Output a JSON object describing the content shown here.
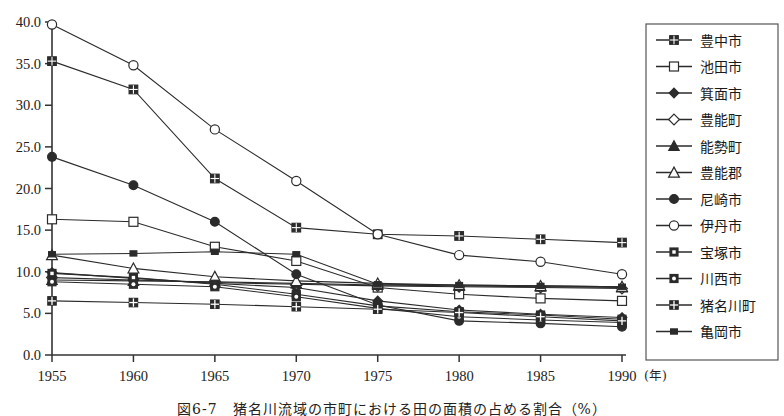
{
  "figure": {
    "caption": "図6-7　猪名川流域の市町における田の面積の占める割合（%）",
    "x_unit_label": "(年)"
  },
  "chart_data": {
    "type": "line",
    "title": "猪名川流域の市町における田の面積の占める割合（%）",
    "xlabel": "年",
    "ylabel": "",
    "x": [
      1955,
      1960,
      1965,
      1970,
      1975,
      1980,
      1985,
      1990
    ],
    "xlim": [
      1955,
      1990
    ],
    "ylim": [
      0.0,
      40.0
    ],
    "ytick_labels": [
      "0.0",
      "5.0",
      "10.0",
      "15.0",
      "20.0",
      "25.0",
      "30.0",
      "35.0",
      "40.0"
    ],
    "yticks": [
      0.0,
      5.0,
      10.0,
      15.0,
      20.0,
      25.0,
      30.0,
      35.0,
      40.0
    ],
    "xtick_labels": [
      "1955",
      "1960",
      "1965",
      "1970",
      "1975",
      "1980",
      "1985",
      "1990"
    ],
    "grid": false,
    "legend_position": "right",
    "series": [
      {
        "name": "豊中市",
        "marker": "filled-square-grid",
        "values": [
          35.3,
          31.9,
          21.2,
          15.3,
          14.5,
          14.3,
          13.9,
          13.5
        ]
      },
      {
        "name": "池田市",
        "marker": "open-square",
        "values": [
          16.3,
          16.0,
          13.0,
          11.3,
          8.1,
          7.3,
          6.8,
          6.5
        ]
      },
      {
        "name": "箕面市",
        "marker": "filled-diamond",
        "values": [
          9.9,
          9.2,
          8.6,
          8.1,
          6.5,
          5.4,
          4.9,
          4.5
        ]
      },
      {
        "name": "豊能町",
        "marker": "open-diamond",
        "values": [
          9.3,
          9.0,
          8.7,
          8.5,
          8.3,
          8.2,
          8.1,
          8.0
        ]
      },
      {
        "name": "能勢町",
        "marker": "filled-triangle",
        "values": [
          9.0,
          8.9,
          8.8,
          8.6,
          8.4,
          8.3,
          8.2,
          8.1
        ]
      },
      {
        "name": "豊能郡",
        "marker": "open-triangle",
        "values": [
          12.0,
          10.4,
          9.4,
          8.9,
          8.6,
          8.4,
          8.3,
          8.2
        ]
      },
      {
        "name": "尼崎市",
        "marker": "filled-circle",
        "values": [
          23.8,
          20.4,
          16.0,
          9.7,
          6.0,
          4.1,
          3.8,
          3.4
        ]
      },
      {
        "name": "伊丹市",
        "marker": "open-circle",
        "values": [
          39.7,
          34.8,
          27.1,
          20.9,
          14.5,
          12.0,
          11.2,
          9.7
        ]
      },
      {
        "name": "宝塚市",
        "marker": "square-dot-small",
        "values": [
          9.8,
          9.3,
          8.5,
          7.3,
          5.9,
          5.2,
          4.8,
          4.3
        ]
      },
      {
        "name": "川西市",
        "marker": "square-ring-small",
        "values": [
          8.8,
          8.5,
          8.2,
          7.0,
          5.6,
          4.6,
          4.2,
          3.9
        ]
      },
      {
        "name": "猪名川町",
        "marker": "square-cross-small",
        "values": [
          6.5,
          6.3,
          6.1,
          5.8,
          5.5,
          5.1,
          4.6,
          4.1
        ]
      },
      {
        "name": "亀岡市",
        "marker": "small-filled-square",
        "values": [
          12.1,
          12.2,
          12.4,
          12.1,
          8.5,
          8.4,
          8.3,
          8.2
        ]
      }
    ]
  },
  "legend": {
    "items": [
      {
        "label": "豊中市"
      },
      {
        "label": "池田市"
      },
      {
        "label": "箕面市"
      },
      {
        "label": "豊能町"
      },
      {
        "label": "能勢町"
      },
      {
        "label": "豊能郡"
      },
      {
        "label": "尼崎市"
      },
      {
        "label": "伊丹市"
      },
      {
        "label": "宝塚市"
      },
      {
        "label": "川西市"
      },
      {
        "label": "猪名川町"
      },
      {
        "label": "亀岡市"
      }
    ]
  },
  "colors": {
    "line": "#2b2b2b",
    "axis": "#333333",
    "text": "#1a1a1a",
    "background": "#ffffff",
    "legend_border": "#555555"
  }
}
